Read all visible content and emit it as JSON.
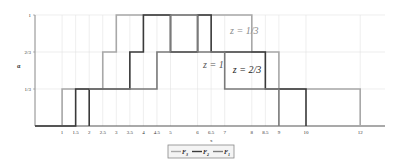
{
  "chart_data": {
    "type": "line",
    "step": true,
    "title": "",
    "xlabel": "x",
    "ylabel": "α",
    "xlim": [
      0,
      13
    ],
    "ylim": [
      0,
      1
    ],
    "grid": true,
    "x_ticks": [
      1,
      1.5,
      2,
      2.5,
      3,
      3.5,
      4,
      4.5,
      5,
      6,
      6.5,
      7,
      8,
      8.5,
      9,
      10,
      12
    ],
    "x_tick_labels": [
      "1",
      "1.5",
      "2",
      "2.5",
      "3",
      "3.5",
      "4",
      "4.5",
      "5",
      "6",
      "6.5",
      "7",
      "8",
      "8.5",
      "9",
      "10",
      "12"
    ],
    "y_ticks": [
      0.3333,
      0.6667,
      1
    ],
    "y_tick_labels": [
      "1/3",
      "2/3",
      "1"
    ],
    "legend_position": "bottom",
    "series": [
      {
        "name": "F3",
        "color": "#a8a8a8",
        "width": 1.6,
        "steps": [
          [
            0,
            0
          ],
          [
            1,
            0.3333
          ],
          [
            2.5,
            0.6667
          ],
          [
            3,
            1
          ],
          [
            8,
            0.6667
          ],
          [
            9,
            0.3333
          ],
          [
            12,
            0
          ]
        ]
      },
      {
        "name": "F2",
        "color": "#3a3a3a",
        "width": 1.6,
        "steps": [
          [
            0,
            0
          ],
          [
            1.5,
            0.3333
          ],
          [
            2,
            0
          ],
          [
            2,
            0.3333
          ],
          [
            3.5,
            0.6667
          ],
          [
            4,
            1
          ],
          [
            5,
            0.6667
          ],
          [
            6,
            1
          ],
          [
            6.5,
            0.6667
          ],
          [
            8.5,
            0.3333
          ],
          [
            10,
            0
          ]
        ]
      },
      {
        "name": "F1",
        "color": "#7a7a7a",
        "width": 1.6,
        "steps": [
          [
            2,
            0.3333
          ],
          [
            4.5,
            0.6667
          ],
          [
            5,
            1
          ],
          [
            6,
            0.6667
          ],
          [
            7,
            0.3333
          ],
          [
            9,
            0
          ]
        ]
      }
    ],
    "annotations": [
      {
        "text": "z = 1/3",
        "x": 7.2,
        "y": 0.83,
        "color": "#8a8a8a"
      },
      {
        "text": "z = 1",
        "x": 6.2,
        "y": 0.52,
        "color": "#555555"
      },
      {
        "text": "z = 2/3",
        "x": 7.3,
        "y": 0.48,
        "color": "#222222"
      }
    ]
  },
  "legend": {
    "items": [
      {
        "label": "F",
        "sub": "3",
        "color": "#a8a8a8"
      },
      {
        "label": "F",
        "sub": "2",
        "color": "#3a3a3a"
      },
      {
        "label": "F",
        "sub": "1",
        "color": "#7a7a7a"
      }
    ]
  }
}
